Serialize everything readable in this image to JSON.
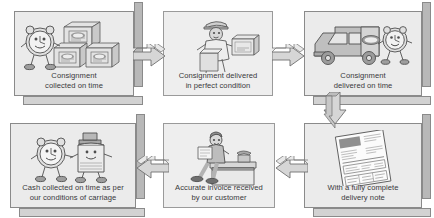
{
  "diagram": {
    "background_color": "#ffffff",
    "panel_fill": "#ebebeb",
    "panel_border": "#8a8a8a",
    "depth_right_color": "#b8b8b8",
    "depth_bottom_color": "#d2d2d2",
    "arrow_fill": "#d6d6d6",
    "arrow_stroke": "#6f6f6f",
    "text_color": "#39393b"
  },
  "steps": [
    {
      "id": "consignment-collected",
      "line1": "Consignment",
      "line2": "collected on time",
      "art": "clock-character-with-parcels",
      "style": "boxed"
    },
    {
      "id": "consignment-delivered-perfect",
      "line1": "Consignment delivered",
      "line2": "in perfect condition",
      "art": "delivery-person-with-parcel",
      "style": "flat"
    },
    {
      "id": "consignment-delivered-on-time",
      "line1": "Consignment",
      "line2": "delivered on time",
      "art": "delivery-van-with-clock-character",
      "style": "boxed"
    },
    {
      "id": "delivery-note",
      "line1": "With a fully complete",
      "line2": "delivery note",
      "art": "delivery-note-document",
      "style": "boxed"
    },
    {
      "id": "accurate-invoice",
      "line1": "Accurate invoice received",
      "line2": "by our customer",
      "art": "person-seated-on-desk",
      "style": "flat"
    },
    {
      "id": "cash-collected",
      "line1": "Cash collected on time as per",
      "line2": "our conditions of carriage",
      "art": "clock-and-money-characters",
      "style": "boxed"
    }
  ],
  "connectors": [
    {
      "id": "collected-to-perfect",
      "direction": "right",
      "icon": "arrow-right-icon"
    },
    {
      "id": "perfect-to-on-time",
      "direction": "right",
      "icon": "arrow-right-icon"
    },
    {
      "id": "on-time-to-note",
      "direction": "down",
      "icon": "arrow-down-icon"
    },
    {
      "id": "note-to-invoice",
      "direction": "left",
      "icon": "arrow-left-icon"
    },
    {
      "id": "invoice-to-cash",
      "direction": "left",
      "icon": "arrow-left-icon"
    }
  ]
}
